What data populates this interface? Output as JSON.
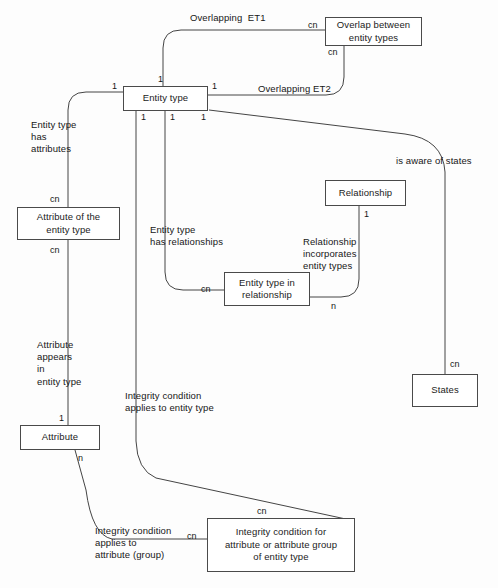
{
  "diagram": {
    "type": "entity-relationship-diagram",
    "line_color": "#444444",
    "box_border_color": "#4a4a4a",
    "background_color": "#fdfdfd",
    "entities": [
      {
        "id": "entity-type",
        "label": "Entity type"
      },
      {
        "id": "overlap-between-entity-types",
        "label": "Overlap between\nentity types"
      },
      {
        "id": "attribute-of-the-entity-type",
        "label": "Attribute of the\nentity type"
      },
      {
        "id": "attribute",
        "label": "Attribute"
      },
      {
        "id": "relationship",
        "label": "Relationship"
      },
      {
        "id": "entity-type-in-relationship",
        "label": "Entity type in\nrelationship"
      },
      {
        "id": "states",
        "label": "States"
      },
      {
        "id": "integrity-condition-for-attribute",
        "label": "Integrity condition for\nattribute or attribute group\nof entity type"
      }
    ],
    "relationship_labels": [
      {
        "id": "overlapping-et1",
        "text": "Overlapping  ET1"
      },
      {
        "id": "overlapping-et2",
        "text": "Overlapping ET2"
      },
      {
        "id": "entity-type-has-attributes",
        "text": "Entity type\nhas\nattributes"
      },
      {
        "id": "entity-type-has-relationships",
        "text": "Entity type\nhas relationships"
      },
      {
        "id": "relationship-incorporates-entity-types",
        "text": "Relationship\nincorporates\nentity types"
      },
      {
        "id": "is-aware-of-states",
        "text": "is aware of states"
      },
      {
        "id": "attribute-appears-in-entity-type",
        "text": "Attribute\nappears\nin\nentity type"
      },
      {
        "id": "integrity-condition-applies-to-entity-type",
        "text": "Integrity condition\napplies to entity type"
      },
      {
        "id": "integrity-condition-applies-to-attribute-group",
        "text": "Integrity condition\napplies to\nattribute (group)"
      }
    ],
    "cardinalities": [
      {
        "id": "card-et-top",
        "text": "1"
      },
      {
        "id": "card-et-left",
        "text": "1"
      },
      {
        "id": "card-et-right",
        "text": "1"
      },
      {
        "id": "card-et-bottom-1",
        "text": "1"
      },
      {
        "id": "card-et-bottom-2",
        "text": "1"
      },
      {
        "id": "card-et-bottom-3",
        "text": "1"
      },
      {
        "id": "card-overlap-left",
        "text": "cn"
      },
      {
        "id": "card-overlap-bottom",
        "text": "cn"
      },
      {
        "id": "card-attribute-of-et-top",
        "text": "cn"
      },
      {
        "id": "card-attribute-of-et-bottom",
        "text": "cn"
      },
      {
        "id": "card-attribute-top",
        "text": "1"
      },
      {
        "id": "card-attribute-bottom",
        "text": "n"
      },
      {
        "id": "card-relationship-bottom",
        "text": "1"
      },
      {
        "id": "card-et-in-rel-left",
        "text": "cn"
      },
      {
        "id": "card-et-in-rel-right",
        "text": "n"
      },
      {
        "id": "card-states-top",
        "text": "cn"
      },
      {
        "id": "card-integrity-top",
        "text": "cn"
      },
      {
        "id": "card-integrity-left",
        "text": "cn"
      }
    ]
  }
}
